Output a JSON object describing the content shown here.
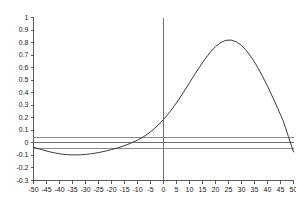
{
  "chart_data": {
    "type": "line",
    "title": "",
    "subtitle": "",
    "xlabel": "",
    "ylabel": "",
    "xlim": [
      -50,
      50
    ],
    "ylim": [
      -0.3,
      1.0
    ],
    "grid": false,
    "legend": null,
    "legend_position": "none",
    "x_ticks": [
      -50,
      -45,
      -40,
      -35,
      -30,
      -25,
      -20,
      -15,
      -10,
      -5,
      0,
      5,
      10,
      15,
      20,
      25,
      30,
      35,
      40,
      45,
      50
    ],
    "x_tick_labels": [
      "-50",
      "-45",
      "-40",
      "-35",
      "-30",
      "-25",
      "-20",
      "-15",
      "-10",
      "-5",
      "0",
      "5",
      "10",
      "15",
      "20",
      "25",
      "30",
      "35",
      "40",
      "45",
      "50"
    ],
    "y_ticks": [
      -0.3,
      -0.2,
      -0.1,
      0,
      0.1,
      0.2,
      0.3,
      0.4,
      0.5,
      0.6,
      0.7,
      0.8,
      0.9,
      1.0
    ],
    "y_tick_labels": [
      "-0.3",
      "-0.2",
      "-0.1",
      "0",
      "0.1",
      "0.2",
      "0.3",
      "0.4",
      "0.5",
      "0.6",
      "0.7",
      "0.8",
      "0.9",
      "1"
    ],
    "series": [
      {
        "name": "cross-correlation",
        "color": "#3c3c3c",
        "x": [
          -50,
          -48,
          -46,
          -44,
          -42,
          -40,
          -38,
          -36,
          -34,
          -32,
          -30,
          -28,
          -26,
          -24,
          -22,
          -20,
          -18,
          -16,
          -14,
          -12,
          -10,
          -8,
          -6,
          -4,
          -2,
          0,
          2,
          4,
          6,
          8,
          10,
          12,
          14,
          16,
          18,
          20,
          22,
          24,
          26,
          28,
          30,
          32,
          34,
          36,
          38,
          40,
          42,
          44,
          46,
          48,
          50
        ],
        "y": [
          -0.035,
          -0.047,
          -0.059,
          -0.07,
          -0.079,
          -0.087,
          -0.092,
          -0.095,
          -0.096,
          -0.095,
          -0.092,
          -0.087,
          -0.081,
          -0.073,
          -0.064,
          -0.054,
          -0.042,
          -0.029,
          -0.014,
          0.003,
          0.022,
          0.045,
          0.072,
          0.105,
          0.143,
          0.187,
          0.236,
          0.29,
          0.35,
          0.414,
          0.48,
          0.546,
          0.61,
          0.67,
          0.723,
          0.768,
          0.8,
          0.818,
          0.82,
          0.806,
          0.777,
          0.733,
          0.677,
          0.61,
          0.535,
          0.452,
          0.364,
          0.272,
          0.178,
          0.053,
          -0.072
        ]
      }
    ],
    "reference_lines": {
      "horizontal": [
        {
          "value": 0.042,
          "color": "#8c8c8c",
          "name": "upper-confidence-bound"
        },
        {
          "value": 0.0,
          "color": "#6e6e6e",
          "name": "zero-line"
        },
        {
          "value": -0.042,
          "color": "#8c8c8c",
          "name": "lower-confidence-bound"
        }
      ],
      "vertical": [
        {
          "value": 0,
          "color": "#6e6e6e",
          "name": "zero-lag-line"
        }
      ]
    },
    "axes": {
      "left_spine": true,
      "bottom_spine": true,
      "top_spine": false,
      "right_spine": false,
      "spine_color": "#5a5a5a"
    }
  }
}
